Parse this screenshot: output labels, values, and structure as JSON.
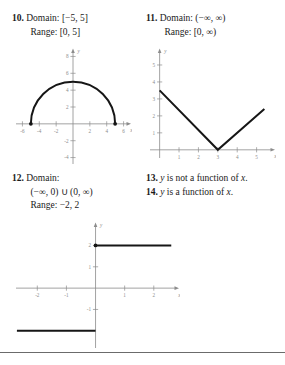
{
  "page": {
    "background_color": "#ffffff",
    "text_color": "#1a1a1a",
    "axis_color": "#8c8c8c",
    "curve_color": "#161616",
    "rule_color": "#6b6b6b"
  },
  "answers": {
    "item10": {
      "number": "10.",
      "line1_label": "Domain:",
      "line1_value": "[−5, 5]",
      "line2_label": "Range:",
      "line2_value": "[0, 5]"
    },
    "item11": {
      "number": "11.",
      "line1_label": "Domain:",
      "line1_value": "(−∞, ∞)",
      "line2_label": "Range:",
      "line2_value": "[0, ∞)"
    },
    "item12": {
      "number": "12.",
      "line1_label": "Domain:",
      "line2_value": "(−∞, 0) ∪ (0, ∞)",
      "line3_label": "Range:",
      "line3_value": "−2, 2"
    },
    "item13": {
      "number": "13.",
      "text_pre": "y",
      "text_mid": " is not a function of ",
      "text_var": "x",
      "text_end": "."
    },
    "item14": {
      "number": "14.",
      "text_pre": "y",
      "text_mid": " is a function of ",
      "text_var": "x",
      "text_end": "."
    }
  },
  "chart_data": [
    {
      "id": "graph-10",
      "type": "line",
      "title": "",
      "xlabel": "x",
      "ylabel": "y",
      "xlim": [
        -7,
        7
      ],
      "ylim": [
        -5,
        9
      ],
      "x_ticks": [
        -6,
        -4,
        -2,
        2,
        4,
        6
      ],
      "y_ticks": [
        -4,
        -2,
        2,
        4,
        6,
        8
      ],
      "grid": false,
      "legend": "none",
      "description": "Upper semicircle of radius 5 centered at the origin",
      "curve": "semicircle",
      "radius": 5,
      "center": [
        0,
        0
      ],
      "endpoints": [
        [
          -5,
          0
        ],
        [
          5,
          0
        ]
      ],
      "endpoint_style": "closed-dot",
      "x": [
        -5,
        -4,
        -3,
        -2,
        -1,
        0,
        1,
        2,
        3,
        4,
        5
      ],
      "y": [
        0,
        3,
        4,
        4.58,
        4.9,
        5,
        4.9,
        4.58,
        4,
        3,
        0
      ]
    },
    {
      "id": "graph-11",
      "type": "line",
      "title": "",
      "xlabel": "x",
      "ylabel": "y",
      "xlim": [
        -0.6,
        6
      ],
      "ylim": [
        -0.6,
        6
      ],
      "x_ticks": [
        1,
        2,
        3,
        4,
        5
      ],
      "y_ticks": [
        1,
        2,
        3,
        4,
        5
      ],
      "grid": false,
      "legend": "none",
      "description": "V-shaped absolute value graph with vertex at (3, 0)",
      "curve": "absolute-value",
      "vertex": [
        3,
        0
      ],
      "x": [
        0,
        3,
        5.4
      ],
      "y": [
        3.5,
        0,
        2.4
      ]
    },
    {
      "id": "graph-12",
      "type": "line",
      "title": "",
      "xlabel": "x",
      "ylabel": "y",
      "xlim": [
        -2.8,
        2.9
      ],
      "ylim": [
        -2.9,
        3.1
      ],
      "x_ticks": [
        -2,
        -1,
        1,
        2
      ],
      "y_ticks": [
        -1,
        1,
        2
      ],
      "grid": false,
      "legend": "none",
      "description": "Step function: y = -2 for x < 0, y = 2 for x > 0, open/closed at x = 0",
      "curve": "step",
      "segments": [
        {
          "from": [
            -2.7,
            -2
          ],
          "to": [
            0,
            -2
          ]
        },
        {
          "from": [
            0,
            2
          ],
          "to": [
            2.6,
            2
          ]
        }
      ],
      "marker_at_origin_upper": [
        0,
        2
      ]
    }
  ]
}
